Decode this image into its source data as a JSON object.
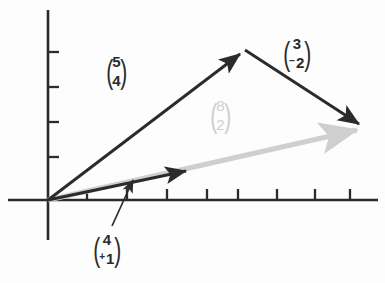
{
  "figure": {
    "type": "vector-addition-diagram",
    "background_color": "#fdfdfd",
    "axis_color": "#2b2b2b",
    "vector_dark_color": "#2b2b2b",
    "vector_grey_color": "#cfcfcf"
  },
  "axes": {
    "origin": {
      "x": 48,
      "y": 200
    },
    "x_axis": {
      "x_start": 8,
      "x_end": 378,
      "y": 200
    },
    "y_axis": {
      "y_start": 10,
      "y_end": 240,
      "x": 48
    },
    "x_ticks": [
      87,
      127,
      167,
      207,
      238,
      277,
      315,
      350
    ],
    "y_ticks": [
      52,
      87,
      122,
      157
    ],
    "tick_length": 11,
    "grid": false
  },
  "vectors": [
    {
      "name": "vector-5-4",
      "components": [
        5,
        4
      ],
      "color": "#2b2b2b",
      "from": {
        "x": 48,
        "y": 200
      },
      "to": {
        "x": 245,
        "y": 50
      },
      "arrowhead": true
    },
    {
      "name": "vector-3-minus2",
      "components": [
        3,
        -2
      ],
      "color": "#2b2b2b",
      "from": {
        "x": 245,
        "y": 50
      },
      "to": {
        "x": 365,
        "y": 128
      },
      "arrowhead": true
    },
    {
      "name": "vector-8-2",
      "components": [
        8,
        2
      ],
      "color": "#cfcfcf",
      "from": {
        "x": 48,
        "y": 200
      },
      "to": {
        "x": 365,
        "y": 128
      },
      "arrowhead": true
    },
    {
      "name": "vector-4-1",
      "components": [
        4,
        1
      ],
      "color": "#2b2b2b",
      "from": {
        "x": 48,
        "y": 200
      },
      "to": {
        "x": 192,
        "y": 169
      },
      "arrowhead": true
    }
  ],
  "leader_line": {
    "name": "leader-line-to-vector-4-1",
    "from": {
      "x": 112,
      "y": 226
    },
    "to": {
      "x": 136,
      "y": 174
    },
    "arrowhead": true,
    "color": "#2b2b2b"
  },
  "labels": {
    "vector_5_4": {
      "top": "5",
      "bottom": "4",
      "top_sign": "",
      "bottom_sign": ""
    },
    "vector_3_minus2": {
      "top": "3",
      "bottom": "2",
      "top_sign": "",
      "bottom_sign": "−"
    },
    "vector_8_2": {
      "top": "8",
      "bottom": "2",
      "top_sign": "",
      "bottom_sign": ""
    },
    "vector_4_plus1": {
      "top": "4",
      "bottom": "1",
      "top_sign": "",
      "bottom_sign": "+"
    },
    "paren_left": "(",
    "paren_right": ")"
  }
}
